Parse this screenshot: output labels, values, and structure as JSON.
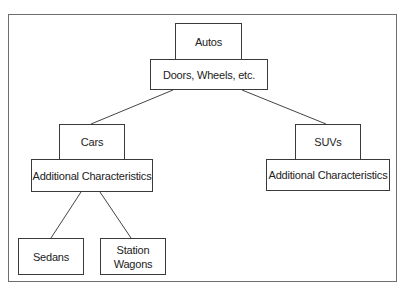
{
  "diagram": {
    "type": "class-hierarchy",
    "root": {
      "label": "Autos",
      "attributes": "Doors, Wheels, etc."
    },
    "children": [
      {
        "label": "Cars",
        "attributes": "Additional Characteristics",
        "children": [
          {
            "label": "Sedans"
          },
          {
            "label": "Station Wagons",
            "line1": "Station",
            "line2": "Wagons"
          }
        ]
      },
      {
        "label": "SUVs",
        "attributes": "Additional Characteristics"
      }
    ],
    "colors": {
      "border": "#3a3a3a",
      "frame": "#6e6e6e",
      "text": "#222222",
      "background": "#ffffff"
    }
  }
}
